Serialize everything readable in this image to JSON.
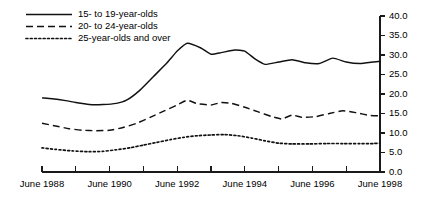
{
  "chart_data": {
    "type": "line",
    "title": "",
    "subtitle": "",
    "xlabel": "",
    "ylabel": "",
    "ylim": [
      0.0,
      40.0
    ],
    "ytick_labels": [
      "40.0",
      "35.0",
      "30.0",
      "25.0",
      "20.0",
      "15.0",
      "10.0",
      "5.0",
      "0.0"
    ],
    "ytick_values": [
      40.0,
      35.0,
      30.0,
      25.0,
      20.0,
      15.0,
      10.0,
      5.0,
      0.0
    ],
    "xlim": [
      1988,
      1998
    ],
    "x": [
      1988,
      1989,
      1990,
      1991,
      1992,
      1993,
      1994,
      1995,
      1996,
      1997,
      1998
    ],
    "xtick_values": [
      1988,
      1989,
      1990,
      1991,
      1992,
      1993,
      1994,
      1995,
      1996,
      1997,
      1998
    ],
    "xtick_labels": [
      "June 1988",
      "",
      "June 1990",
      "",
      "June 1992",
      "",
      "June 1994",
      "",
      "June 1996",
      "",
      "June 1998"
    ],
    "axis_position": "right",
    "grid": false,
    "legend_position": "top-left",
    "series": [
      {
        "name": "15- to 19-year-olds",
        "style": "solid",
        "values": [
          19.0,
          17.8,
          17.4,
          24.0,
          33.0,
          29.8,
          28.2,
          28.6,
          28.2,
          28.4,
          28.2
        ],
        "points": [
          {
            "x": 1988.0,
            "y": 19.0
          },
          {
            "x": 1988.3,
            "y": 18.8
          },
          {
            "x": 1988.7,
            "y": 18.3
          },
          {
            "x": 1989.0,
            "y": 17.8
          },
          {
            "x": 1989.4,
            "y": 17.3
          },
          {
            "x": 1989.8,
            "y": 17.3
          },
          {
            "x": 1990.2,
            "y": 17.6
          },
          {
            "x": 1990.5,
            "y": 18.4
          },
          {
            "x": 1990.9,
            "y": 21.0
          },
          {
            "x": 1991.3,
            "y": 24.5
          },
          {
            "x": 1991.7,
            "y": 28.0
          },
          {
            "x": 1992.0,
            "y": 31.0
          },
          {
            "x": 1992.3,
            "y": 33.0
          },
          {
            "x": 1992.7,
            "y": 31.8
          },
          {
            "x": 1993.0,
            "y": 30.2
          },
          {
            "x": 1993.3,
            "y": 30.6
          },
          {
            "x": 1993.7,
            "y": 31.3
          },
          {
            "x": 1994.0,
            "y": 31.0
          },
          {
            "x": 1994.3,
            "y": 29.0
          },
          {
            "x": 1994.6,
            "y": 27.6
          },
          {
            "x": 1995.0,
            "y": 28.2
          },
          {
            "x": 1995.4,
            "y": 28.8
          },
          {
            "x": 1995.8,
            "y": 28.0
          },
          {
            "x": 1996.2,
            "y": 27.8
          },
          {
            "x": 1996.6,
            "y": 29.2
          },
          {
            "x": 1997.0,
            "y": 28.2
          },
          {
            "x": 1997.4,
            "y": 27.8
          },
          {
            "x": 1997.8,
            "y": 28.2
          },
          {
            "x": 1998.0,
            "y": 28.4
          }
        ]
      },
      {
        "name": "20- to 24-year-olds",
        "style": "dashed",
        "values": [
          12.5,
          11.0,
          10.6,
          13.4,
          18.4,
          17.6,
          16.0,
          14.4,
          14.6,
          15.6,
          14.4
        ],
        "points": [
          {
            "x": 1988.0,
            "y": 12.5
          },
          {
            "x": 1988.4,
            "y": 11.8
          },
          {
            "x": 1988.8,
            "y": 11.1
          },
          {
            "x": 1989.2,
            "y": 10.7
          },
          {
            "x": 1989.6,
            "y": 10.6
          },
          {
            "x": 1990.0,
            "y": 10.7
          },
          {
            "x": 1990.4,
            "y": 11.4
          },
          {
            "x": 1990.8,
            "y": 12.5
          },
          {
            "x": 1991.2,
            "y": 14.0
          },
          {
            "x": 1991.6,
            "y": 15.6
          },
          {
            "x": 1992.0,
            "y": 17.2
          },
          {
            "x": 1992.3,
            "y": 18.4
          },
          {
            "x": 1992.6,
            "y": 17.5
          },
          {
            "x": 1993.0,
            "y": 17.2
          },
          {
            "x": 1993.3,
            "y": 17.8
          },
          {
            "x": 1993.6,
            "y": 17.6
          },
          {
            "x": 1994.0,
            "y": 16.6
          },
          {
            "x": 1994.4,
            "y": 15.4
          },
          {
            "x": 1994.8,
            "y": 14.2
          },
          {
            "x": 1995.1,
            "y": 13.6
          },
          {
            "x": 1995.4,
            "y": 14.6
          },
          {
            "x": 1995.7,
            "y": 14.0
          },
          {
            "x": 1996.1,
            "y": 14.2
          },
          {
            "x": 1996.5,
            "y": 15.0
          },
          {
            "x": 1996.9,
            "y": 15.7
          },
          {
            "x": 1997.3,
            "y": 15.2
          },
          {
            "x": 1997.7,
            "y": 14.5
          },
          {
            "x": 1998.0,
            "y": 14.4
          }
        ]
      },
      {
        "name": "25-year-olds and over",
        "style": "dotted",
        "values": [
          6.2,
          5.4,
          5.2,
          6.6,
          8.8,
          9.6,
          8.6,
          7.4,
          7.2,
          7.4,
          7.2
        ],
        "points": [
          {
            "x": 1988.0,
            "y": 6.2
          },
          {
            "x": 1988.4,
            "y": 5.8
          },
          {
            "x": 1988.9,
            "y": 5.4
          },
          {
            "x": 1989.4,
            "y": 5.2
          },
          {
            "x": 1989.8,
            "y": 5.3
          },
          {
            "x": 1990.2,
            "y": 5.7
          },
          {
            "x": 1990.6,
            "y": 6.2
          },
          {
            "x": 1991.0,
            "y": 6.9
          },
          {
            "x": 1991.4,
            "y": 7.6
          },
          {
            "x": 1991.8,
            "y": 8.3
          },
          {
            "x": 1992.2,
            "y": 8.9
          },
          {
            "x": 1992.6,
            "y": 9.3
          },
          {
            "x": 1993.0,
            "y": 9.5
          },
          {
            "x": 1993.4,
            "y": 9.6
          },
          {
            "x": 1993.8,
            "y": 9.3
          },
          {
            "x": 1994.2,
            "y": 8.7
          },
          {
            "x": 1994.6,
            "y": 8.0
          },
          {
            "x": 1995.0,
            "y": 7.4
          },
          {
            "x": 1995.4,
            "y": 7.2
          },
          {
            "x": 1995.9,
            "y": 7.2
          },
          {
            "x": 1996.4,
            "y": 7.3
          },
          {
            "x": 1996.9,
            "y": 7.3
          },
          {
            "x": 1997.4,
            "y": 7.3
          },
          {
            "x": 1997.8,
            "y": 7.3
          },
          {
            "x": 1998.0,
            "y": 7.4
          }
        ]
      }
    ]
  },
  "legend": {
    "items": [
      {
        "label": "15- to 19-year-olds",
        "style": "solid"
      },
      {
        "label": "20- to 24-year-olds",
        "style": "dashed"
      },
      {
        "label": "25-year-olds and over",
        "style": "dotted"
      }
    ]
  },
  "colors": {
    "line": "#111111",
    "axis": "#1a1a1a",
    "text": "#000000",
    "background": "#ffffff"
  }
}
